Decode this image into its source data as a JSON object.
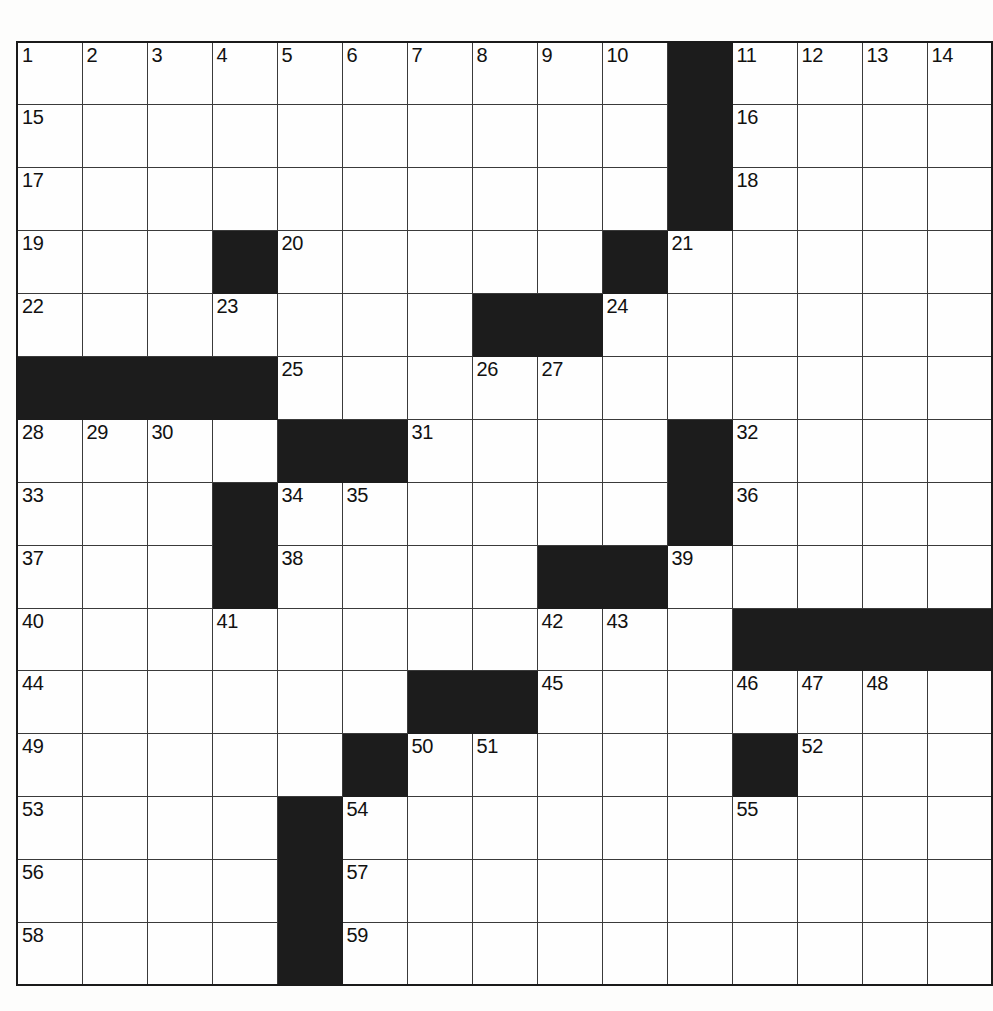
{
  "puzzle": {
    "type": "crossword-grid",
    "rows": 15,
    "cols": 14,
    "cell_size_px": 65,
    "colors": {
      "page_background": "#fdfdfc",
      "cell_background": "#fefefe",
      "block_background": "#1c1c1c",
      "grid_line": "#3a3a3a",
      "outer_border": "#1a1a1a",
      "number_text": "#111111"
    },
    "numbers_present": [
      1,
      2,
      3,
      4,
      5,
      6,
      7,
      8,
      9,
      10,
      11,
      12,
      13,
      14,
      15,
      16,
      17,
      18,
      19,
      20,
      21,
      22,
      23,
      24,
      25,
      26,
      27,
      28,
      29,
      30,
      31,
      32,
      33,
      34,
      35,
      36,
      37,
      38,
      39,
      40,
      41,
      42,
      43,
      44,
      45,
      46,
      47,
      48,
      49,
      50,
      51,
      52,
      53,
      54,
      55,
      56,
      57,
      58,
      59
    ],
    "grid": [
      [
        {
          "block": false,
          "num": "1"
        },
        {
          "block": false,
          "num": "2"
        },
        {
          "block": false,
          "num": "3"
        },
        {
          "block": false,
          "num": "4"
        },
        {
          "block": false,
          "num": "5"
        },
        {
          "block": false,
          "num": "6"
        },
        {
          "block": false,
          "num": "7"
        },
        {
          "block": false,
          "num": "8"
        },
        {
          "block": false,
          "num": "9"
        },
        {
          "block": false,
          "num": "10"
        },
        {
          "block": true,
          "num": ""
        },
        {
          "block": false,
          "num": "11"
        },
        {
          "block": false,
          "num": "12"
        },
        {
          "block": false,
          "num": "13"
        },
        {
          "block": false,
          "num": "14"
        }
      ],
      [
        {
          "block": false,
          "num": "15"
        },
        {
          "block": false,
          "num": ""
        },
        {
          "block": false,
          "num": ""
        },
        {
          "block": false,
          "num": ""
        },
        {
          "block": false,
          "num": ""
        },
        {
          "block": false,
          "num": ""
        },
        {
          "block": false,
          "num": ""
        },
        {
          "block": false,
          "num": ""
        },
        {
          "block": false,
          "num": ""
        },
        {
          "block": false,
          "num": ""
        },
        {
          "block": true,
          "num": ""
        },
        {
          "block": false,
          "num": "16"
        },
        {
          "block": false,
          "num": ""
        },
        {
          "block": false,
          "num": ""
        },
        {
          "block": false,
          "num": ""
        }
      ],
      [
        {
          "block": false,
          "num": "17"
        },
        {
          "block": false,
          "num": ""
        },
        {
          "block": false,
          "num": ""
        },
        {
          "block": false,
          "num": ""
        },
        {
          "block": false,
          "num": ""
        },
        {
          "block": false,
          "num": ""
        },
        {
          "block": false,
          "num": ""
        },
        {
          "block": false,
          "num": ""
        },
        {
          "block": false,
          "num": ""
        },
        {
          "block": false,
          "num": ""
        },
        {
          "block": true,
          "num": ""
        },
        {
          "block": false,
          "num": "18"
        },
        {
          "block": false,
          "num": ""
        },
        {
          "block": false,
          "num": ""
        },
        {
          "block": false,
          "num": ""
        }
      ],
      [
        {
          "block": false,
          "num": "19"
        },
        {
          "block": false,
          "num": ""
        },
        {
          "block": false,
          "num": ""
        },
        {
          "block": true,
          "num": ""
        },
        {
          "block": false,
          "num": "20"
        },
        {
          "block": false,
          "num": ""
        },
        {
          "block": false,
          "num": ""
        },
        {
          "block": false,
          "num": ""
        },
        {
          "block": false,
          "num": ""
        },
        {
          "block": true,
          "num": ""
        },
        {
          "block": false,
          "num": "21"
        },
        {
          "block": false,
          "num": ""
        },
        {
          "block": false,
          "num": ""
        },
        {
          "block": false,
          "num": ""
        },
        {
          "block": false,
          "num": ""
        }
      ],
      [
        {
          "block": false,
          "num": "22"
        },
        {
          "block": false,
          "num": ""
        },
        {
          "block": false,
          "num": ""
        },
        {
          "block": false,
          "num": "23"
        },
        {
          "block": false,
          "num": ""
        },
        {
          "block": false,
          "num": ""
        },
        {
          "block": false,
          "num": ""
        },
        {
          "block": true,
          "num": ""
        },
        {
          "block": true,
          "num": ""
        },
        {
          "block": false,
          "num": "24"
        },
        {
          "block": false,
          "num": ""
        },
        {
          "block": false,
          "num": ""
        },
        {
          "block": false,
          "num": ""
        },
        {
          "block": false,
          "num": ""
        },
        {
          "block": false,
          "num": ""
        }
      ],
      [
        {
          "block": true,
          "num": ""
        },
        {
          "block": true,
          "num": ""
        },
        {
          "block": true,
          "num": ""
        },
        {
          "block": true,
          "num": ""
        },
        {
          "block": false,
          "num": "25"
        },
        {
          "block": false,
          "num": ""
        },
        {
          "block": false,
          "num": ""
        },
        {
          "block": false,
          "num": "26"
        },
        {
          "block": false,
          "num": "27"
        },
        {
          "block": false,
          "num": ""
        },
        {
          "block": false,
          "num": ""
        },
        {
          "block": false,
          "num": ""
        },
        {
          "block": false,
          "num": ""
        },
        {
          "block": false,
          "num": ""
        },
        {
          "block": false,
          "num": ""
        }
      ],
      [
        {
          "block": false,
          "num": "28"
        },
        {
          "block": false,
          "num": "29"
        },
        {
          "block": false,
          "num": "30"
        },
        {
          "block": false,
          "num": ""
        },
        {
          "block": true,
          "num": ""
        },
        {
          "block": true,
          "num": ""
        },
        {
          "block": false,
          "num": "31"
        },
        {
          "block": false,
          "num": ""
        },
        {
          "block": false,
          "num": ""
        },
        {
          "block": false,
          "num": ""
        },
        {
          "block": true,
          "num": ""
        },
        {
          "block": false,
          "num": "32"
        },
        {
          "block": false,
          "num": ""
        },
        {
          "block": false,
          "num": ""
        },
        {
          "block": false,
          "num": ""
        }
      ],
      [
        {
          "block": false,
          "num": "33"
        },
        {
          "block": false,
          "num": ""
        },
        {
          "block": false,
          "num": ""
        },
        {
          "block": true,
          "num": ""
        },
        {
          "block": false,
          "num": "34"
        },
        {
          "block": false,
          "num": "35"
        },
        {
          "block": false,
          "num": ""
        },
        {
          "block": false,
          "num": ""
        },
        {
          "block": false,
          "num": ""
        },
        {
          "block": false,
          "num": ""
        },
        {
          "block": true,
          "num": ""
        },
        {
          "block": false,
          "num": "36"
        },
        {
          "block": false,
          "num": ""
        },
        {
          "block": false,
          "num": ""
        },
        {
          "block": false,
          "num": ""
        }
      ],
      [
        {
          "block": false,
          "num": "37"
        },
        {
          "block": false,
          "num": ""
        },
        {
          "block": false,
          "num": ""
        },
        {
          "block": true,
          "num": ""
        },
        {
          "block": false,
          "num": "38"
        },
        {
          "block": false,
          "num": ""
        },
        {
          "block": false,
          "num": ""
        },
        {
          "block": false,
          "num": ""
        },
        {
          "block": true,
          "num": ""
        },
        {
          "block": true,
          "num": ""
        },
        {
          "block": false,
          "num": "39"
        },
        {
          "block": false,
          "num": ""
        },
        {
          "block": false,
          "num": ""
        },
        {
          "block": false,
          "num": ""
        },
        {
          "block": false,
          "num": ""
        }
      ],
      [
        {
          "block": false,
          "num": "40"
        },
        {
          "block": false,
          "num": ""
        },
        {
          "block": false,
          "num": ""
        },
        {
          "block": false,
          "num": "41"
        },
        {
          "block": false,
          "num": ""
        },
        {
          "block": false,
          "num": ""
        },
        {
          "block": false,
          "num": ""
        },
        {
          "block": false,
          "num": ""
        },
        {
          "block": false,
          "num": "42"
        },
        {
          "block": false,
          "num": "43"
        },
        {
          "block": false,
          "num": ""
        },
        {
          "block": true,
          "num": ""
        },
        {
          "block": true,
          "num": ""
        },
        {
          "block": true,
          "num": ""
        },
        {
          "block": true,
          "num": ""
        }
      ],
      [
        {
          "block": false,
          "num": "44"
        },
        {
          "block": false,
          "num": ""
        },
        {
          "block": false,
          "num": ""
        },
        {
          "block": false,
          "num": ""
        },
        {
          "block": false,
          "num": ""
        },
        {
          "block": false,
          "num": ""
        },
        {
          "block": true,
          "num": ""
        },
        {
          "block": true,
          "num": ""
        },
        {
          "block": false,
          "num": "45"
        },
        {
          "block": false,
          "num": ""
        },
        {
          "block": false,
          "num": ""
        },
        {
          "block": false,
          "num": "46"
        },
        {
          "block": false,
          "num": "47"
        },
        {
          "block": false,
          "num": "48"
        },
        {
          "block": false,
          "num": ""
        }
      ],
      [
        {
          "block": false,
          "num": "49"
        },
        {
          "block": false,
          "num": ""
        },
        {
          "block": false,
          "num": ""
        },
        {
          "block": false,
          "num": ""
        },
        {
          "block": false,
          "num": ""
        },
        {
          "block": true,
          "num": ""
        },
        {
          "block": false,
          "num": "50"
        },
        {
          "block": false,
          "num": "51"
        },
        {
          "block": false,
          "num": ""
        },
        {
          "block": false,
          "num": ""
        },
        {
          "block": false,
          "num": ""
        },
        {
          "block": true,
          "num": ""
        },
        {
          "block": false,
          "num": "52"
        },
        {
          "block": false,
          "num": ""
        },
        {
          "block": false,
          "num": ""
        }
      ],
      [
        {
          "block": false,
          "num": "53"
        },
        {
          "block": false,
          "num": ""
        },
        {
          "block": false,
          "num": ""
        },
        {
          "block": false,
          "num": ""
        },
        {
          "block": true,
          "num": ""
        },
        {
          "block": false,
          "num": "54"
        },
        {
          "block": false,
          "num": ""
        },
        {
          "block": false,
          "num": ""
        },
        {
          "block": false,
          "num": ""
        },
        {
          "block": false,
          "num": ""
        },
        {
          "block": false,
          "num": ""
        },
        {
          "block": false,
          "num": "55"
        },
        {
          "block": false,
          "num": ""
        },
        {
          "block": false,
          "num": ""
        },
        {
          "block": false,
          "num": ""
        }
      ],
      [
        {
          "block": false,
          "num": "56"
        },
        {
          "block": false,
          "num": ""
        },
        {
          "block": false,
          "num": ""
        },
        {
          "block": false,
          "num": ""
        },
        {
          "block": true,
          "num": ""
        },
        {
          "block": false,
          "num": "57"
        },
        {
          "block": false,
          "num": ""
        },
        {
          "block": false,
          "num": ""
        },
        {
          "block": false,
          "num": ""
        },
        {
          "block": false,
          "num": ""
        },
        {
          "block": false,
          "num": ""
        },
        {
          "block": false,
          "num": ""
        },
        {
          "block": false,
          "num": ""
        },
        {
          "block": false,
          "num": ""
        },
        {
          "block": false,
          "num": ""
        }
      ],
      [
        {
          "block": false,
          "num": "58"
        },
        {
          "block": false,
          "num": ""
        },
        {
          "block": false,
          "num": ""
        },
        {
          "block": false,
          "num": ""
        },
        {
          "block": true,
          "num": ""
        },
        {
          "block": false,
          "num": "59"
        },
        {
          "block": false,
          "num": ""
        },
        {
          "block": false,
          "num": ""
        },
        {
          "block": false,
          "num": ""
        },
        {
          "block": false,
          "num": ""
        },
        {
          "block": false,
          "num": ""
        },
        {
          "block": false,
          "num": ""
        },
        {
          "block": false,
          "num": ""
        },
        {
          "block": false,
          "num": ""
        },
        {
          "block": false,
          "num": ""
        }
      ]
    ]
  }
}
